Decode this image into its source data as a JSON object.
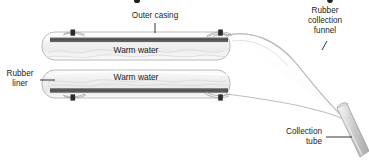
{
  "figure": {
    "title_fragment_visible": "",
    "background_color": "#ffffff",
    "labels": {
      "outer_casing": "Outer casing",
      "rubber_liner_line1": "Rubber",
      "rubber_liner_line2": "liner",
      "rubber_funnel_line1": "Rubber",
      "rubber_funnel_line2": "collection",
      "rubber_funnel_line3": "funnel",
      "collection_tube_line1": "Collection",
      "collection_tube_line2": "tube",
      "warm_water_top": "Warm water",
      "warm_water_bottom": "Warm water"
    },
    "colors": {
      "text": "#231f20",
      "casing_outline": "#b3b3b3",
      "dark_bar": "#58595b",
      "tube_fill": "#f2f2f2",
      "funnel_stroke": "#bfbfbf",
      "collection_tube": "#c9c9c9"
    },
    "parts": [
      "top-tube-assembly",
      "bottom-tube-assembly",
      "rubber-collection-funnel",
      "collection-tube"
    ]
  }
}
